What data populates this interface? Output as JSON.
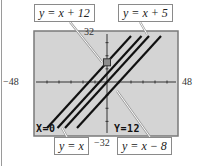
{
  "chart_data": {
    "type": "line",
    "title": "",
    "xlabel": "",
    "ylabel": "",
    "xlim": [
      -48,
      48
    ],
    "ylim": [
      -32,
      32
    ],
    "tick_labels": {
      "xmin": "−48",
      "xmax": "48",
      "ymin": "−32",
      "ymax": "32"
    },
    "x_tick_step": 8,
    "y_tick_step": 8,
    "grid": false,
    "background": "#d4d4d4",
    "series": [
      {
        "name": "y = x + 12",
        "slope": 1,
        "intercept": 12
      },
      {
        "name": "y = x + 5",
        "slope": 1,
        "intercept": 5
      },
      {
        "name": "y = x",
        "slope": 1,
        "intercept": 0
      },
      {
        "name": "y = x − 8",
        "slope": 1,
        "intercept": -8
      }
    ],
    "cursor": {
      "x": 0,
      "y": 12
    },
    "annotations": {
      "trace_x": "X=0",
      "trace_y": "Y=12"
    }
  }
}
